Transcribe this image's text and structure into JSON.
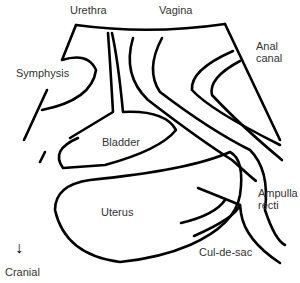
{
  "labels": {
    "urethra": "Urethra",
    "vagina": "Vagina",
    "symphysis": "Symphysis",
    "anal_canal_1": "Anal",
    "anal_canal_2": "canal",
    "bladder": "Bladder",
    "uterus": "Uterus",
    "ampulla_1": "Ampulla",
    "ampulla_2": "recti",
    "cul_de_sac": "Cul-de-sac",
    "cranial": "Cranial"
  },
  "orientation_arrow": "↓",
  "stroke_color": "#000000"
}
